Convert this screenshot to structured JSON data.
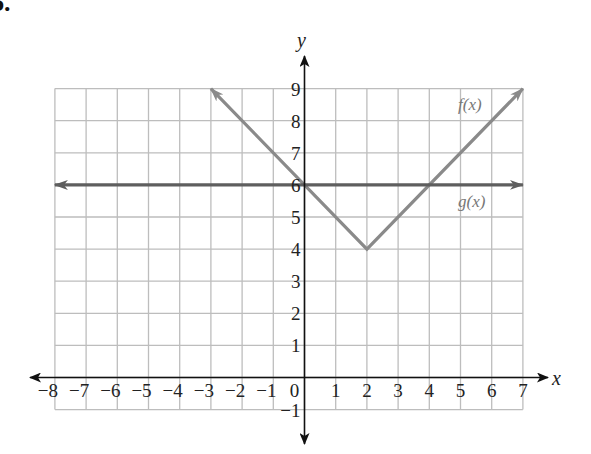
{
  "problem": {
    "label": "6."
  },
  "chart_data": {
    "type": "line",
    "title": "",
    "xlabel": "x",
    "ylabel": "y",
    "xlim": [
      -8,
      7
    ],
    "ylim": [
      -1,
      9
    ],
    "grid": true,
    "x_ticks": [
      "-8",
      "-7",
      "-6",
      "-5",
      "-4",
      "-3",
      "-2",
      "-1",
      "0",
      "1",
      "2",
      "3",
      "4",
      "5",
      "6",
      "7"
    ],
    "y_ticks": [
      "-1",
      "1",
      "2",
      "3",
      "4",
      "5",
      "6",
      "7",
      "8",
      "9"
    ],
    "series": [
      {
        "name": "f(x)",
        "label": "f(x)",
        "equation": "f(x) = |x - 2| + 4",
        "color": "#8a8a8a",
        "points": [
          [
            -3,
            9
          ],
          [
            2,
            4
          ],
          [
            7,
            9
          ]
        ],
        "arrows": "both"
      },
      {
        "name": "g(x)",
        "label": "g(x)",
        "equation": "g(x) = 6",
        "color": "#5e5e5e",
        "points": [
          [
            -8,
            6
          ],
          [
            7,
            6
          ]
        ],
        "arrows": "both"
      }
    ],
    "intersections": [
      [
        0,
        6
      ],
      [
        4,
        6
      ]
    ],
    "colors": {
      "axis": "#111111",
      "grid": "#bdbdbd",
      "f": "#8a8a8a",
      "g": "#5e5e5e"
    }
  }
}
